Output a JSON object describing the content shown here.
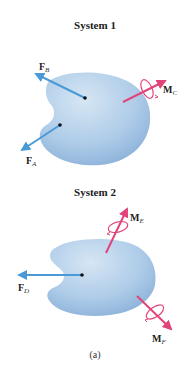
{
  "figure": {
    "caption": "(a)",
    "colors": {
      "body_fill_light": "#cfe1f2",
      "body_fill_dark": "#8fb6dc",
      "force_arrow": "#4a9ad8",
      "moment_arrow": "#e2447a",
      "point": "#111111"
    },
    "systems": [
      {
        "title": "System 1",
        "forces": [
          {
            "name": "F",
            "subscript": "B"
          },
          {
            "name": "F",
            "subscript": "A"
          }
        ],
        "moments": [
          {
            "name": "M",
            "subscript": "C"
          }
        ]
      },
      {
        "title": "System 2",
        "forces": [
          {
            "name": "F",
            "subscript": "D"
          }
        ],
        "moments": [
          {
            "name": "M",
            "subscript": "E"
          },
          {
            "name": "M",
            "subscript": "F"
          }
        ]
      }
    ]
  }
}
